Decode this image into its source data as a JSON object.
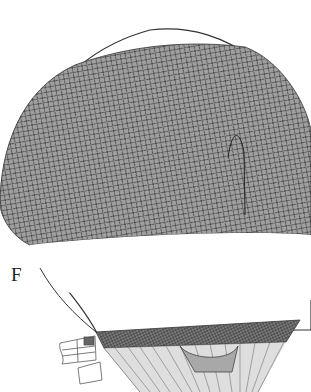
{
  "image": {
    "subject": "hot-air balloon with net",
    "figure_label": "F",
    "colors": {
      "net_fill": "#9a9a9a",
      "net_lines": "#3a3a3a",
      "outline": "#333333",
      "band": "#ffffff",
      "lower_fill": "#b5b5b5"
    }
  }
}
